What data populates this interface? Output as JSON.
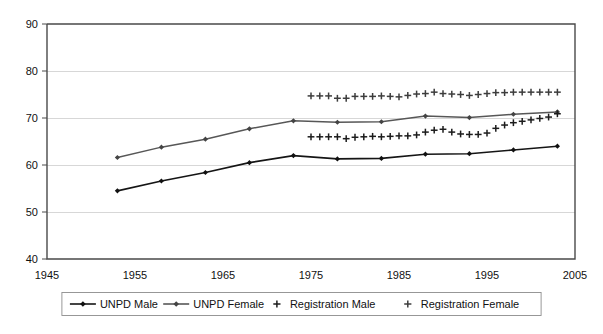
{
  "chart_data": {
    "type": "line",
    "title": "",
    "subtitle": "",
    "xlabel": "",
    "ylabel": "",
    "xlim": [
      1945,
      2005
    ],
    "ylim": [
      40,
      90
    ],
    "xticks": [
      1945,
      1955,
      1965,
      1975,
      1985,
      1995,
      2005
    ],
    "yticks": [
      40,
      50,
      60,
      70,
      80,
      90
    ],
    "grid": true,
    "legend_position": "bottom",
    "series": [
      {
        "name": "UNPD Male",
        "marker": "diamond",
        "color": "#151515",
        "x": [
          1953,
          1958,
          1963,
          1968,
          1973,
          1978,
          1983,
          1988,
          1993,
          1998,
          2003
        ],
        "values": [
          54.5,
          56.6,
          58.4,
          60.5,
          62.0,
          61.3,
          61.4,
          62.3,
          62.4,
          63.2,
          64.0
        ]
      },
      {
        "name": "UNPD Female",
        "marker": "diamond",
        "color": "#575757",
        "x": [
          1953,
          1958,
          1963,
          1968,
          1973,
          1978,
          1983,
          1988,
          1993,
          1998,
          2003
        ],
        "values": [
          61.6,
          63.8,
          65.5,
          67.7,
          69.4,
          69.1,
          69.2,
          70.4,
          70.1,
          70.8,
          71.3
        ]
      },
      {
        "name": "Registration Male",
        "marker": "plus",
        "color": "#1c1c1c",
        "x": [
          1975,
          1976,
          1977,
          1978,
          1979,
          1980,
          1981,
          1982,
          1983,
          1984,
          1985,
          1986,
          1987,
          1988,
          1989,
          1990,
          1991,
          1992,
          1993,
          1994,
          1995,
          1996,
          1997,
          1998,
          1999,
          2000,
          2001,
          2002,
          2003
        ],
        "values": [
          66.0,
          66.0,
          66.0,
          66.0,
          65.6,
          65.9,
          66.0,
          66.1,
          66.0,
          66.1,
          66.2,
          66.2,
          66.4,
          67.0,
          67.4,
          67.6,
          67.0,
          66.6,
          66.5,
          66.5,
          66.8,
          67.8,
          68.5,
          69.0,
          69.3,
          69.6,
          69.9,
          70.2,
          70.9
        ]
      },
      {
        "name": "Registration Female",
        "marker": "plus",
        "color": "#3d3d3d",
        "x": [
          1975,
          1976,
          1977,
          1978,
          1979,
          1980,
          1981,
          1982,
          1983,
          1984,
          1985,
          1986,
          1987,
          1988,
          1989,
          1990,
          1991,
          1992,
          1993,
          1994,
          1995,
          1996,
          1997,
          1998,
          1999,
          2000,
          2001,
          2002,
          2003
        ],
        "values": [
          74.7,
          74.7,
          74.7,
          74.2,
          74.2,
          74.6,
          74.6,
          74.6,
          74.7,
          74.6,
          74.5,
          74.8,
          75.1,
          75.2,
          75.5,
          75.2,
          75.1,
          75.0,
          74.8,
          75.0,
          75.2,
          75.4,
          75.4,
          75.5,
          75.5,
          75.5,
          75.5,
          75.5,
          75.5
        ]
      }
    ]
  },
  "legend": {
    "items": [
      {
        "label": "UNPD Male",
        "marker": "line-diamond"
      },
      {
        "label": "UNPD Female",
        "marker": "line-diamond"
      },
      {
        "label": "Registration Male",
        "marker": "plus"
      },
      {
        "label": "Registration Female",
        "marker": "plus"
      }
    ]
  },
  "axes": {
    "y_tick_labels": [
      "90",
      "80",
      "70",
      "60",
      "50",
      "40"
    ],
    "x_tick_labels": [
      "1945",
      "1955",
      "1965",
      "1975",
      "1985",
      "1995",
      "2005"
    ]
  }
}
